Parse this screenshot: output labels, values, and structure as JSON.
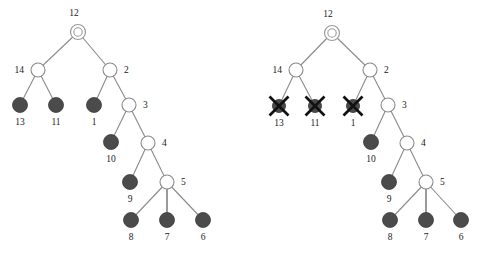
{
  "figure": {
    "background_color": "#ffffff",
    "node_fill_color": "#4b4b4b",
    "node_open_color": "#ffffff",
    "edge_color": "#8a8a8a",
    "cross_color": "#111111",
    "panel_count": 2
  },
  "panels": [
    {
      "id": "left-tree",
      "name": "tree-before-deletion",
      "root": {
        "label": "12",
        "x": 78,
        "y": 32,
        "kind": "root-double",
        "label_x": 74,
        "label_y": 16,
        "label_anchor": "middle"
      },
      "nodes": [
        {
          "label": "14",
          "x": 38,
          "y": 70,
          "kind": "open",
          "label_x": 24,
          "label_y": 73,
          "label_anchor": "end"
        },
        {
          "label": "2",
          "x": 110,
          "y": 70,
          "kind": "open",
          "label_x": 124,
          "label_y": 73,
          "label_anchor": "start"
        },
        {
          "label": "13",
          "x": 20,
          "y": 105,
          "kind": "filled",
          "label_x": 20,
          "label_y": 125,
          "label_anchor": "middle"
        },
        {
          "label": "11",
          "x": 56,
          "y": 105,
          "kind": "filled",
          "label_x": 56,
          "label_y": 125,
          "label_anchor": "middle"
        },
        {
          "label": "1",
          "x": 94,
          "y": 105,
          "kind": "filled",
          "label_x": 94,
          "label_y": 125,
          "label_anchor": "middle"
        },
        {
          "label": "3",
          "x": 129,
          "y": 105,
          "kind": "open",
          "label_x": 143,
          "label_y": 108,
          "label_anchor": "start"
        },
        {
          "label": "10",
          "x": 111,
          "y": 142,
          "kind": "filled",
          "label_x": 111,
          "label_y": 162,
          "label_anchor": "middle"
        },
        {
          "label": "4",
          "x": 148,
          "y": 143,
          "kind": "open",
          "label_x": 162,
          "label_y": 146,
          "label_anchor": "start"
        },
        {
          "label": "9",
          "x": 130,
          "y": 182,
          "kind": "filled",
          "label_x": 130,
          "label_y": 202,
          "label_anchor": "middle"
        },
        {
          "label": "5",
          "x": 167,
          "y": 182,
          "kind": "open",
          "label_x": 181,
          "label_y": 185,
          "label_anchor": "start"
        },
        {
          "label": "8",
          "x": 131,
          "y": 220,
          "kind": "filled",
          "label_x": 131,
          "label_y": 240,
          "label_anchor": "middle"
        },
        {
          "label": "7",
          "x": 167,
          "y": 220,
          "kind": "filled",
          "label_x": 167,
          "label_y": 240,
          "label_anchor": "middle"
        },
        {
          "label": "6",
          "x": 203,
          "y": 220,
          "kind": "filled",
          "label_x": 203,
          "label_y": 240,
          "label_anchor": "middle"
        }
      ],
      "edges": [
        {
          "from": "12",
          "to": "14",
          "x1": 78,
          "y1": 32,
          "x2": 38,
          "y2": 70
        },
        {
          "from": "12",
          "to": "2",
          "x1": 78,
          "y1": 32,
          "x2": 110,
          "y2": 70
        },
        {
          "from": "14",
          "to": "13",
          "x1": 38,
          "y1": 70,
          "x2": 20,
          "y2": 105
        },
        {
          "from": "14",
          "to": "11",
          "x1": 38,
          "y1": 70,
          "x2": 56,
          "y2": 105
        },
        {
          "from": "2",
          "to": "1",
          "x1": 110,
          "y1": 70,
          "x2": 94,
          "y2": 105
        },
        {
          "from": "2",
          "to": "3",
          "x1": 110,
          "y1": 70,
          "x2": 129,
          "y2": 105
        },
        {
          "from": "3",
          "to": "10",
          "x1": 129,
          "y1": 105,
          "x2": 111,
          "y2": 142
        },
        {
          "from": "3",
          "to": "4",
          "x1": 129,
          "y1": 105,
          "x2": 148,
          "y2": 143
        },
        {
          "from": "4",
          "to": "9",
          "x1": 148,
          "y1": 143,
          "x2": 130,
          "y2": 182
        },
        {
          "from": "4",
          "to": "5",
          "x1": 148,
          "y1": 143,
          "x2": 167,
          "y2": 182
        },
        {
          "from": "5",
          "to": "8",
          "x1": 167,
          "y1": 182,
          "x2": 131,
          "y2": 220
        },
        {
          "from": "5",
          "to": "7",
          "x1": 167,
          "y1": 182,
          "x2": 167,
          "y2": 220
        },
        {
          "from": "5",
          "to": "6",
          "x1": 167,
          "y1": 182,
          "x2": 203,
          "y2": 220
        }
      ]
    },
    {
      "id": "right-tree",
      "name": "tree-after-deletion",
      "root": {
        "label": "12",
        "x": 332,
        "y": 33,
        "kind": "root-double",
        "label_x": 328,
        "label_y": 17,
        "label_anchor": "middle"
      },
      "nodes": [
        {
          "label": "14",
          "x": 296,
          "y": 70,
          "kind": "open",
          "label_x": 282,
          "label_y": 73,
          "label_anchor": "end"
        },
        {
          "label": "2",
          "x": 370,
          "y": 70,
          "kind": "open",
          "label_x": 384,
          "label_y": 73,
          "label_anchor": "start"
        },
        {
          "label": "13",
          "x": 279,
          "y": 106,
          "kind": "deleted",
          "label_x": 279,
          "label_y": 126,
          "label_anchor": "middle"
        },
        {
          "label": "11",
          "x": 315,
          "y": 106,
          "kind": "deleted",
          "label_x": 315,
          "label_y": 126,
          "label_anchor": "middle"
        },
        {
          "label": "1",
          "x": 353,
          "y": 106,
          "kind": "deleted",
          "label_x": 353,
          "label_y": 126,
          "label_anchor": "middle"
        },
        {
          "label": "3",
          "x": 388,
          "y": 105,
          "kind": "open",
          "label_x": 402,
          "label_y": 108,
          "label_anchor": "start"
        },
        {
          "label": "10",
          "x": 371,
          "y": 142,
          "kind": "filled",
          "label_x": 371,
          "label_y": 162,
          "label_anchor": "middle"
        },
        {
          "label": "4",
          "x": 407,
          "y": 143,
          "kind": "open",
          "label_x": 421,
          "label_y": 146,
          "label_anchor": "start"
        },
        {
          "label": "9",
          "x": 389,
          "y": 182,
          "kind": "filled",
          "label_x": 389,
          "label_y": 202,
          "label_anchor": "middle"
        },
        {
          "label": "5",
          "x": 426,
          "y": 182,
          "kind": "open",
          "label_x": 440,
          "label_y": 185,
          "label_anchor": "start"
        },
        {
          "label": "8",
          "x": 390,
          "y": 220,
          "kind": "filled",
          "label_x": 390,
          "label_y": 240,
          "label_anchor": "middle"
        },
        {
          "label": "7",
          "x": 426,
          "y": 220,
          "kind": "filled",
          "label_x": 426,
          "label_y": 240,
          "label_anchor": "middle"
        },
        {
          "label": "6",
          "x": 461,
          "y": 220,
          "kind": "filled",
          "label_x": 461,
          "label_y": 240,
          "label_anchor": "middle"
        }
      ],
      "edges": [
        {
          "from": "12",
          "to": "14",
          "x1": 332,
          "y1": 33,
          "x2": 296,
          "y2": 70
        },
        {
          "from": "12",
          "to": "2",
          "x1": 332,
          "y1": 33,
          "x2": 370,
          "y2": 70
        },
        {
          "from": "14",
          "to": "13",
          "x1": 296,
          "y1": 70,
          "x2": 279,
          "y2": 106
        },
        {
          "from": "14",
          "to": "11",
          "x1": 296,
          "y1": 70,
          "x2": 315,
          "y2": 106
        },
        {
          "from": "2",
          "to": "1",
          "x1": 370,
          "y1": 70,
          "x2": 353,
          "y2": 106
        },
        {
          "from": "2",
          "to": "3",
          "x1": 370,
          "y1": 70,
          "x2": 388,
          "y2": 105
        },
        {
          "from": "3",
          "to": "10",
          "x1": 388,
          "y1": 105,
          "x2": 371,
          "y2": 142
        },
        {
          "from": "3",
          "to": "4",
          "x1": 388,
          "y1": 105,
          "x2": 407,
          "y2": 143
        },
        {
          "from": "4",
          "to": "9",
          "x1": 407,
          "y1": 143,
          "x2": 389,
          "y2": 182
        },
        {
          "from": "4",
          "to": "5",
          "x1": 407,
          "y1": 143,
          "x2": 426,
          "y2": 182
        },
        {
          "from": "5",
          "to": "8",
          "x1": 426,
          "y1": 182,
          "x2": 390,
          "y2": 220
        },
        {
          "from": "5",
          "to": "7",
          "x1": 426,
          "y1": 182,
          "x2": 426,
          "y2": 220
        },
        {
          "from": "5",
          "to": "6",
          "x1": 426,
          "y1": 182,
          "x2": 461,
          "y2": 220
        }
      ]
    }
  ],
  "geometry": {
    "open_radius": 7,
    "filled_radius": 7.5,
    "root_outer_radius": 7.5,
    "root_inner_radius": 4.2,
    "deleted_radius": 6.5,
    "cross_half_length": 9.5
  }
}
